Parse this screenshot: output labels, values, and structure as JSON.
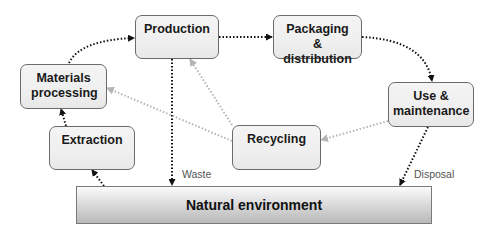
{
  "diagram": {
    "nodes": {
      "production": "Production",
      "packaging": "Packaging & distribution",
      "materials": "Materials processing",
      "use": "Use & maintenance",
      "extraction": "Extraction",
      "recycling": "Recycling",
      "environment": "Natural environment"
    },
    "edge_labels": {
      "waste": "Waste",
      "disposal": "Disposal"
    },
    "edges": [
      {
        "from": "Natural environment",
        "to": "Extraction",
        "style": "black-dotted"
      },
      {
        "from": "Extraction",
        "to": "Materials processing",
        "style": "black-dotted"
      },
      {
        "from": "Materials processing",
        "to": "Production",
        "style": "black-dotted"
      },
      {
        "from": "Production",
        "to": "Packaging & distribution",
        "style": "black-dotted"
      },
      {
        "from": "Packaging & distribution",
        "to": "Use & maintenance",
        "style": "black-dotted"
      },
      {
        "from": "Production",
        "to": "Natural environment",
        "label": "Waste",
        "style": "black-dotted"
      },
      {
        "from": "Use & maintenance",
        "to": "Natural environment",
        "label": "Disposal",
        "style": "black-dotted"
      },
      {
        "from": "Use & maintenance",
        "to": "Recycling",
        "style": "grey-dotted"
      },
      {
        "from": "Recycling",
        "to": "Production",
        "style": "grey-dotted"
      },
      {
        "from": "Recycling",
        "to": "Materials processing",
        "style": "grey-dotted"
      }
    ],
    "colors": {
      "flow_arrow": "#111111",
      "recycle_arrow": "#b0b0b0",
      "box_border": "#6b6b6b",
      "box_fill": "#f0f0f0"
    }
  }
}
